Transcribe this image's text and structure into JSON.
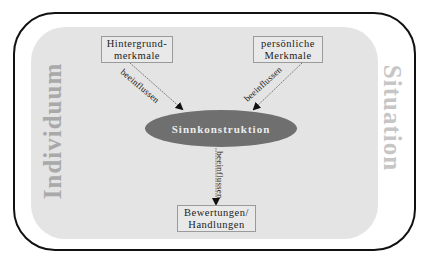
{
  "diagram": {
    "outer_frame": {
      "label_left": "Individuum",
      "label_right": "Situation"
    },
    "nodes": {
      "hintergrund": {
        "line1": "Hintergrund-",
        "line2": "merkmale"
      },
      "persoenlich": {
        "line1": "persönliche",
        "line2": "Merkmale"
      },
      "sinnkonstruktion": {
        "label": "Sinnkonstruktion"
      },
      "bewertungen": {
        "line1": "Bewertungen/",
        "line2": "Handlungen"
      }
    },
    "edges": [
      {
        "from": "Hintergrundmerkmale",
        "to": "Sinnkonstruktion",
        "label": "beeinflussen"
      },
      {
        "from": "persönliche Merkmale",
        "to": "Sinnkonstruktion",
        "label": "beeinflussen"
      },
      {
        "from": "Sinnkonstruktion",
        "to": "Bewertungen/Handlungen",
        "label": "beeinflussen"
      }
    ],
    "colors": {
      "ellipse_fill": "#6f6f6f",
      "inner_background": "#e4e4e4",
      "outer_border": "#111111",
      "side_label_left": "#a9a9a9",
      "side_label_right": "#c6c6c6"
    }
  }
}
